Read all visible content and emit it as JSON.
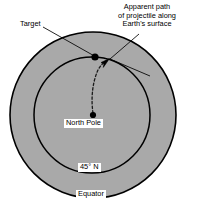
{
  "figure": {
    "colors": {
      "earth_fill": "#a9a9a9",
      "outline": "#000000",
      "label_background": "#ffffff",
      "page_background": "#ffffff"
    },
    "geometry": {
      "equator_circle": {
        "cx": 93,
        "cy": 115,
        "r": 83
      },
      "latitude_circle": {
        "cx": 92,
        "cy": 115,
        "r": 58
      },
      "north_pole_point": {
        "x": 93,
        "y": 115
      },
      "target_point": {
        "x": 95,
        "y": 57
      },
      "arrow_tip": {
        "x": 108,
        "y": 60
      }
    },
    "labels": {
      "target": "Target",
      "apparent_path_line1": "Apparent path",
      "apparent_path_line2": "of projectile along",
      "apparent_path_line3": "Earth's surface",
      "north_pole": "North Pole",
      "latitude": "45° N",
      "equator": "Equator"
    }
  }
}
